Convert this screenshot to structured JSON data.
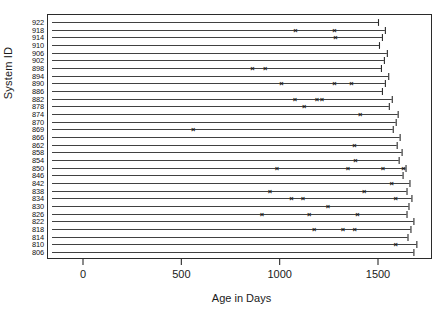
{
  "chart_data": {
    "type": "scatter",
    "title": "",
    "xlabel": "Age in Days",
    "ylabel": "System ID",
    "xlim": [
      0,
      1700
    ],
    "xticks": [
      0,
      500,
      1000,
      1500
    ],
    "xticklabels": [
      "0",
      "500",
      "1000",
      "1500"
    ],
    "grid": false,
    "legend": null,
    "categories": [
      "922",
      "918",
      "914",
      "910",
      "906",
      "902",
      "898",
      "894",
      "890",
      "886",
      "882",
      "878",
      "874",
      "870",
      "869",
      "866",
      "862",
      "858",
      "854",
      "850",
      "846",
      "842",
      "838",
      "834",
      "830",
      "826",
      "822",
      "818",
      "814",
      "810",
      "806"
    ],
    "series": [
      {
        "id": "922",
        "line_end": 1500,
        "events": []
      },
      {
        "id": "918",
        "line_end": 1535,
        "events": [
          1080,
          1278
        ]
      },
      {
        "id": "914",
        "line_end": 1520,
        "events": [
          1283
        ]
      },
      {
        "id": "910",
        "line_end": 1505,
        "events": []
      },
      {
        "id": "906",
        "line_end": 1545,
        "events": []
      },
      {
        "id": "902",
        "line_end": 1530,
        "events": []
      },
      {
        "id": "898",
        "line_end": 1515,
        "events": [
          861,
          927
        ]
      },
      {
        "id": "894",
        "line_end": 1552,
        "events": []
      },
      {
        "id": "890",
        "line_end": 1535,
        "events": [
          1009,
          1278,
          1365
        ]
      },
      {
        "id": "886",
        "line_end": 1520,
        "events": []
      },
      {
        "id": "882",
        "line_end": 1570,
        "events": [
          1078,
          1190,
          1215
        ]
      },
      {
        "id": "878",
        "line_end": 1555,
        "events": [
          1125
        ]
      },
      {
        "id": "874",
        "line_end": 1600,
        "events": [
          1410
        ]
      },
      {
        "id": "870",
        "line_end": 1590,
        "events": []
      },
      {
        "id": "869",
        "line_end": 1575,
        "events": [
          560
        ]
      },
      {
        "id": "866",
        "line_end": 1610,
        "events": []
      },
      {
        "id": "862",
        "line_end": 1595,
        "events": [
          1380
        ]
      },
      {
        "id": "858",
        "line_end": 1620,
        "events": []
      },
      {
        "id": "854",
        "line_end": 1605,
        "events": [
          1385
        ]
      },
      {
        "id": "850",
        "line_end": 1640,
        "events": [
          986,
          1347,
          1525,
          1630
        ]
      },
      {
        "id": "846",
        "line_end": 1625,
        "events": []
      },
      {
        "id": "842",
        "line_end": 1660,
        "events": [
          1570
        ]
      },
      {
        "id": "838",
        "line_end": 1645,
        "events": [
          950,
          1430
        ]
      },
      {
        "id": "834",
        "line_end": 1670,
        "events": [
          1060,
          1118,
          1590
        ]
      },
      {
        "id": "830",
        "line_end": 1655,
        "events": [
          1245
        ]
      },
      {
        "id": "826",
        "line_end": 1645,
        "events": [
          910,
          1150,
          1395
        ]
      },
      {
        "id": "822",
        "line_end": 1680,
        "events": []
      },
      {
        "id": "818",
        "line_end": 1665,
        "events": [
          1175,
          1322,
          1382
        ]
      },
      {
        "id": "814",
        "line_end": 1650,
        "events": []
      },
      {
        "id": "810",
        "line_end": 1695,
        "events": [
          1590
        ]
      },
      {
        "id": "806",
        "line_end": 1680,
        "events": []
      }
    ]
  },
  "axis": {
    "x_label": "Age in Days",
    "y_label": "System ID"
  },
  "colors": {
    "line": "#2b2b2b",
    "marker": "#111111",
    "frame": "#2b2b2b",
    "background": "#ffffff"
  }
}
